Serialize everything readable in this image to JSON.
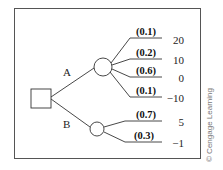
{
  "diagram": {
    "type": "decision-tree",
    "decision_node": {
      "label": ""
    },
    "alternatives": [
      {
        "label": "A",
        "outcomes": [
          {
            "probability": "(0.1)",
            "payoff": "20"
          },
          {
            "probability": "(0.2)",
            "payoff": "10"
          },
          {
            "probability": "(0.6)",
            "payoff": "0"
          },
          {
            "probability": "(0.1)",
            "payoff": "−10"
          }
        ]
      },
      {
        "label": "B",
        "outcomes": [
          {
            "probability": "(0.7)",
            "payoff": "5"
          },
          {
            "probability": "(0.3)",
            "payoff": "−1"
          }
        ]
      }
    ],
    "credit": "© Cengage Learning"
  },
  "colors": {
    "line": "#333333",
    "frame": "#555555",
    "credit": "#777777",
    "background": "#ffffff"
  }
}
